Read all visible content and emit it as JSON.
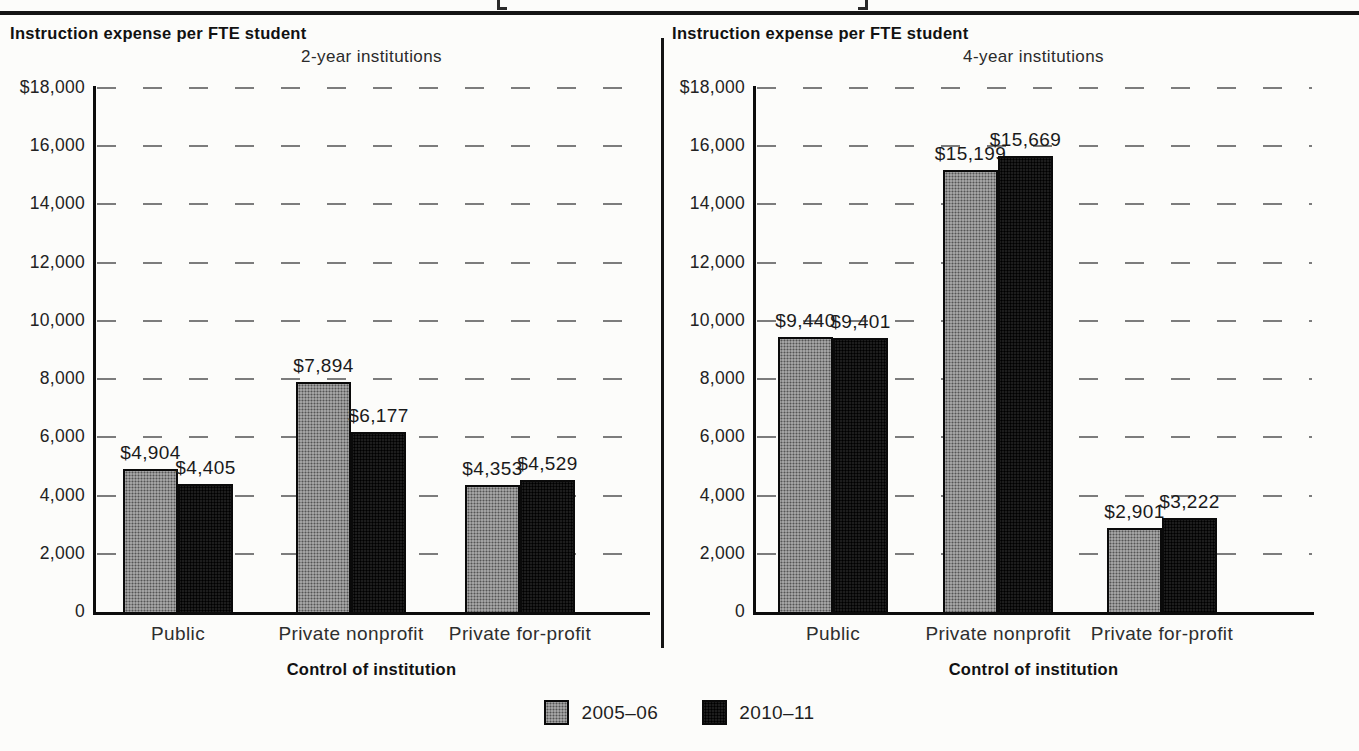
{
  "decorations": {
    "top_cropped_text_visible": "[ ]"
  },
  "legend": {
    "items": [
      {
        "label": "2005–06",
        "swatch": "halftone-gray",
        "color": "#9a9a9a"
      },
      {
        "label": "2010–11",
        "swatch": "solid-black",
        "color": "#1d1d1d"
      }
    ]
  },
  "colors": {
    "series_2005_06": "#9a9a9a",
    "series_2010_11": "#1d1d1d",
    "gridline": "#7c7c7c",
    "axis": "#0c0c0c",
    "paper": "#fcfcfa"
  },
  "chart_data": [
    {
      "type": "bar",
      "title": "Instruction expense per FTE student",
      "subtitle": "2-year institutions",
      "xlabel": "Control of institution",
      "ylabel": "",
      "categories": [
        "Public",
        "Private nonprofit",
        "Private for-profit"
      ],
      "series": [
        {
          "name": "2005–06",
          "values": [
            4904,
            7894,
            4353
          ],
          "labels": [
            "$4,904",
            "$7,894",
            "$4,353"
          ]
        },
        {
          "name": "2010–11",
          "values": [
            4405,
            6177,
            4529
          ],
          "labels": [
            "$4,405",
            "$6,177",
            "$4,529"
          ]
        }
      ],
      "ylim": [
        0,
        18000
      ],
      "ytick_step": 2000,
      "ytick_labels": [
        "$18,000",
        "16,000",
        "14,000",
        "12,000",
        "10,000",
        "8,000",
        "6,000",
        "4,000",
        "2,000",
        "0"
      ],
      "grid": "dashed",
      "legend_position": "bottom-shared"
    },
    {
      "type": "bar",
      "title": "Instruction expense per FTE student",
      "subtitle": "4-year institutions",
      "xlabel": "Control of institution",
      "ylabel": "",
      "categories": [
        "Public",
        "Private nonprofit",
        "Private for-profit"
      ],
      "series": [
        {
          "name": "2005–06",
          "values": [
            9440,
            15199,
            2901
          ],
          "labels": [
            "$9,440",
            "$15,199",
            "$2,901"
          ]
        },
        {
          "name": "2010–11",
          "values": [
            9401,
            15669,
            3222
          ],
          "labels": [
            "$9,401",
            "$15,669",
            "$3,222"
          ]
        }
      ],
      "ylim": [
        0,
        18000
      ],
      "ytick_step": 2000,
      "ytick_labels": [
        "$18,000",
        "16,000",
        "14,000",
        "12,000",
        "10,000",
        "8,000",
        "6,000",
        "4,000",
        "2,000",
        "0"
      ],
      "grid": "dashed",
      "legend_position": "bottom-shared"
    }
  ]
}
